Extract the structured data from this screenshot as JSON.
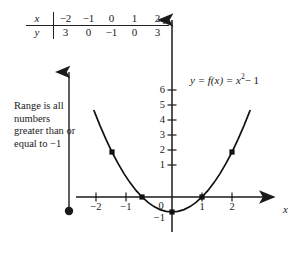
{
  "figure": {
    "equation_label": {
      "lhs": "y = f(x) = x",
      "exponent": "2",
      "rhs": "− 1"
    },
    "annotation": "Range is all numbers greater than or equal to −1",
    "axis_labels": {
      "x": "x",
      "y": "y"
    }
  },
  "value_table": {
    "row_labels": [
      "x",
      "y"
    ],
    "x_values": [
      "−2",
      "−1",
      "0",
      "1",
      "2"
    ],
    "y_values": [
      "3",
      "0",
      "−1",
      "0",
      "3"
    ]
  },
  "chart_data": {
    "type": "line",
    "xlabel": "x",
    "ylabel": "y",
    "function": "y = x^2 - 1",
    "xlim": [
      -2.6,
      2.6
    ],
    "ylim": [
      -1.6,
      6.6
    ],
    "grid": false,
    "legend": "none",
    "x_ticks": [
      -2,
      -1,
      0,
      1,
      2
    ],
    "x_tick_labels": [
      "−2",
      "−1",
      "0",
      "1",
      "2"
    ],
    "y_ticks": [
      -1,
      1,
      2,
      3,
      4,
      5,
      6
    ],
    "y_tick_labels": [
      "−1",
      "1",
      "2",
      "3",
      "4",
      "5",
      "6"
    ],
    "series": [
      {
        "name": "f(x) = x^2 - 1",
        "marked_points": [
          {
            "x": -2,
            "y": 3
          },
          {
            "x": -1,
            "y": 0
          },
          {
            "x": 0,
            "y": -1
          },
          {
            "x": 1,
            "y": 0
          },
          {
            "x": 2,
            "y": 3
          }
        ],
        "x": [
          -2.6,
          -2.4,
          -2.2,
          -2.0,
          -1.8,
          -1.6,
          -1.4,
          -1.2,
          -1.0,
          -0.8,
          -0.6,
          -0.4,
          -0.2,
          0.0,
          0.2,
          0.4,
          0.6,
          0.8,
          1.0,
          1.2,
          1.4,
          1.6,
          1.8,
          2.0,
          2.2,
          2.4,
          2.6
        ],
        "values": [
          5.76,
          4.76,
          3.84,
          3.0,
          2.24,
          1.56,
          0.96,
          0.44,
          0.0,
          -0.36,
          -0.64,
          -0.84,
          -0.96,
          -1.0,
          -0.96,
          -0.84,
          -0.64,
          -0.36,
          0.0,
          0.44,
          0.96,
          1.56,
          2.24,
          3.0,
          3.84,
          4.76,
          5.76
        ]
      }
    ],
    "range_indicator": {
      "label": "Range is all numbers greater than or equal to −1",
      "from_y": -1,
      "closed_endpoint": true,
      "direction": "up",
      "unbounded": true
    }
  },
  "colors": {
    "ink": "#1a1a1a",
    "curve": "#111111",
    "background": "#ffffff"
  }
}
